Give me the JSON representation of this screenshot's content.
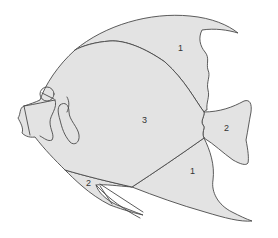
{
  "diagram": {
    "type": "color-by-number",
    "fill_color": "#e3e3e3",
    "stroke_color": "#4a4a4a",
    "background": "#ffffff",
    "labels": {
      "dorsal_fin": "1",
      "body": "3",
      "tail_fin": "2",
      "anal_fin": "1",
      "pelvic_fin": "2"
    }
  }
}
